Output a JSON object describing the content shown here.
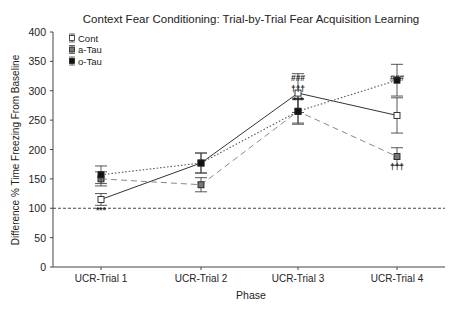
{
  "chart_data": {
    "type": "line",
    "title": "Context Fear Conditioning: Trial-by-Trial Fear Acquisition Learning",
    "xlabel": "Phase",
    "ylabel": "Difference % Time Freezing From Baseline",
    "categories": [
      "UCR-Trial 1",
      "UCR-Trial 2",
      "UCR-Trial 3",
      "UCR-Trial 4"
    ],
    "ylim": [
      0,
      400
    ],
    "yticks": [
      0,
      50,
      100,
      150,
      200,
      250,
      300,
      350,
      400
    ],
    "grid": false,
    "legend_position": "top-left",
    "reference_line": {
      "y": 100,
      "style": "dashed"
    },
    "series": [
      {
        "name": "Cont",
        "marker": "open-square",
        "line": "solid",
        "values": [
          115,
          177,
          296,
          258
        ],
        "errors": [
          10,
          17,
          33,
          30
        ]
      },
      {
        "name": "a-Tau",
        "marker": "gray-square",
        "line": "dashed",
        "values": [
          150,
          140,
          265,
          188
        ],
        "errors": [
          12,
          12,
          20,
          15
        ]
      },
      {
        "name": "o-Tau",
        "marker": "filled-square",
        "line": "dotted",
        "values": [
          157,
          177,
          265,
          318
        ],
        "errors": [
          15,
          17,
          22,
          27
        ]
      }
    ],
    "annotations": [
      {
        "category": "UCR-Trial 1",
        "text": "***",
        "position": "below"
      },
      {
        "category": "UCR-Trial 3",
        "text": "###",
        "position": "above",
        "row": 1
      },
      {
        "category": "UCR-Trial 3",
        "text": "†††",
        "position": "above",
        "row": 2
      },
      {
        "category": "UCR-Trial 3",
        "text": "***",
        "position": "above",
        "row": 3
      },
      {
        "category": "UCR-Trial 4",
        "text": "###",
        "position": "above"
      },
      {
        "category": "UCR-Trial 4",
        "text": "†††",
        "position": "below-cont"
      }
    ]
  }
}
